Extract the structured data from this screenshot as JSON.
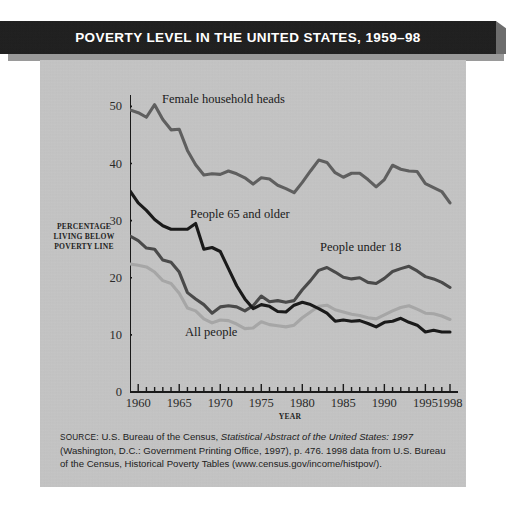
{
  "title": "POVERTY LEVEL IN THE UNITED STATES, 1959–98",
  "colors": {
    "panel_background": "#c6c6c6",
    "title_bar": "#1d1d1d",
    "title_text": "#ffffff",
    "axis": "#1a1a1a",
    "female_household_heads": "#5f5f5f",
    "people_65_and_older": "#1a1a1a",
    "people_under_18": "#4a4a4a",
    "all_people": "#a6a6a6"
  },
  "axis": {
    "y_label_line1": "PERCENTAGE",
    "y_label_line2": "LIVING BELOW",
    "y_label_line3": "POVERTY LINE",
    "x_label": "YEAR",
    "y_ticks": [
      "0",
      "10",
      "20",
      "30",
      "40",
      "50"
    ],
    "x_ticks": [
      "1960",
      "1965",
      "1970",
      "1975",
      "1980",
      "1985",
      "1990",
      "1995",
      "1998"
    ]
  },
  "series_labels": {
    "female": "Female household heads",
    "elderly": "People 65 and older",
    "children": "People under 18",
    "all": "All people"
  },
  "source": {
    "prefix": "SOURCE:",
    "part1": " U.S. Bureau of the Census, ",
    "italic1": "Statistical Abstract of the United States: 1997",
    "part2": " (Washington, D.C.: Government Printing Office, 1997), p. 476. 1998 data from U.S. Bureau of the Census, Historical Poverty Tables (www.census.gov/income/histpov/)."
  },
  "chart_data": {
    "type": "line",
    "title": "POVERTY LEVEL IN THE UNITED STATES, 1959–98",
    "xlabel": "YEAR",
    "ylabel": "PERCENTAGE LIVING BELOW POVERTY LINE",
    "xlim": [
      1959,
      1998
    ],
    "ylim": [
      0,
      52
    ],
    "yticks": [
      0,
      10,
      20,
      30,
      40,
      50
    ],
    "xticks": [
      1960,
      1965,
      1970,
      1975,
      1980,
      1985,
      1990,
      1995,
      1998
    ],
    "grid": false,
    "legend": "inline-annotations",
    "x": [
      1959,
      1960,
      1961,
      1962,
      1963,
      1964,
      1965,
      1966,
      1967,
      1968,
      1969,
      1970,
      1971,
      1972,
      1973,
      1974,
      1975,
      1976,
      1977,
      1978,
      1979,
      1980,
      1981,
      1982,
      1983,
      1984,
      1985,
      1986,
      1987,
      1988,
      1989,
      1990,
      1991,
      1992,
      1993,
      1994,
      1995,
      1996,
      1997,
      1998
    ],
    "series": [
      {
        "name": "Female household heads",
        "color": "#5f5f5f",
        "values": [
          49.4,
          48.9,
          48.1,
          50.3,
          47.7,
          45.9,
          46.0,
          42.3,
          39.8,
          38.0,
          38.2,
          38.1,
          38.7,
          38.2,
          37.5,
          36.4,
          37.5,
          37.3,
          36.2,
          35.6,
          34.9,
          36.7,
          38.7,
          40.6,
          40.2,
          38.4,
          37.6,
          38.3,
          38.3,
          37.2,
          35.9,
          37.2,
          39.7,
          39.0,
          38.7,
          38.6,
          36.5,
          35.8,
          35.1,
          33.1
        ]
      },
      {
        "name": "People 65 and older",
        "color": "#1a1a1a",
        "values": [
          35.2,
          33.1,
          31.8,
          30.2,
          29.1,
          28.5,
          28.5,
          28.5,
          29.5,
          25.0,
          25.3,
          24.6,
          21.6,
          18.6,
          16.3,
          14.6,
          15.3,
          15.0,
          14.1,
          14.0,
          15.2,
          15.7,
          15.3,
          14.6,
          13.8,
          12.4,
          12.6,
          12.4,
          12.5,
          12.0,
          11.4,
          12.2,
          12.4,
          12.9,
          12.2,
          11.7,
          10.5,
          10.8,
          10.5,
          10.5
        ]
      },
      {
        "name": "People under 18",
        "color": "#4a4a4a",
        "values": [
          27.3,
          26.5,
          25.2,
          25.0,
          23.1,
          22.7,
          21.0,
          17.4,
          16.3,
          15.3,
          13.8,
          14.9,
          15.1,
          14.9,
          14.2,
          15.1,
          16.8,
          15.8,
          16.0,
          15.7,
          16.0,
          17.9,
          19.5,
          21.3,
          21.8,
          21.0,
          20.1,
          19.8,
          20.0,
          19.2,
          19.0,
          19.9,
          21.1,
          21.6,
          22.0,
          21.2,
          20.2,
          19.8,
          19.2,
          18.3
        ]
      },
      {
        "name": "All people",
        "color": "#a6a6a6",
        "values": [
          22.4,
          22.2,
          21.9,
          21.0,
          19.5,
          19.0,
          17.3,
          14.7,
          14.2,
          12.8,
          12.1,
          12.6,
          12.5,
          11.9,
          11.1,
          11.2,
          12.3,
          11.8,
          11.6,
          11.4,
          11.7,
          13.0,
          14.0,
          15.0,
          15.2,
          14.4,
          14.0,
          13.6,
          13.4,
          13.0,
          12.8,
          13.5,
          14.2,
          14.8,
          15.1,
          14.5,
          13.8,
          13.7,
          13.3,
          12.7
        ]
      }
    ]
  }
}
